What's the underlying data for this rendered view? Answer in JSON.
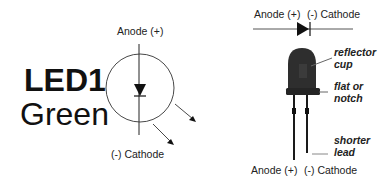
{
  "symbol": {
    "title": "LED1",
    "subtitle": "Green",
    "anode_label": "Anode (+)",
    "cathode_label": "(-) Cathode"
  },
  "component": {
    "top_anode_label": "Anode (+)",
    "top_cathode_label": "(-) Cathode",
    "bottom_anode_label": "Anode (+)",
    "bottom_cathode_label": "(-) Cathode",
    "callouts": [
      {
        "line1": "reflector",
        "line2": "cup"
      },
      {
        "line1": "flat or",
        "line2": "notch"
      },
      {
        "line1": "shorter",
        "line2": "lead"
      }
    ]
  },
  "colors": {
    "ink": "#111111",
    "led_body": "#2a2a2a",
    "line": "#555555"
  }
}
